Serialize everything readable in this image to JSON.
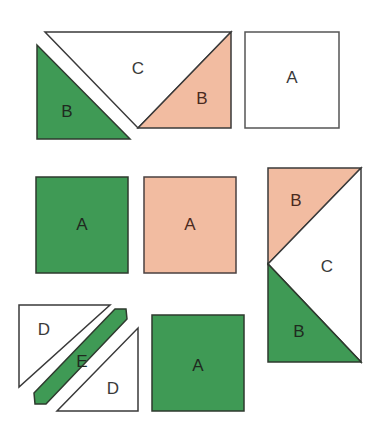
{
  "diagram": {
    "colors": {
      "green": "#3f9a55",
      "peach": "#f2bca1",
      "white": "#ffffff",
      "stroke": "#3a3a3a",
      "label_dark": "#1f2a1f",
      "label_brown": "#4a2a20",
      "label_gray": "#3a3a3a"
    },
    "pieces": [
      {
        "id": "top-c",
        "label": "C",
        "shape": "triangle",
        "fill": "white"
      },
      {
        "id": "top-b-green",
        "label": "B",
        "shape": "triangle",
        "fill": "green"
      },
      {
        "id": "top-b-peach",
        "label": "B",
        "shape": "triangle",
        "fill": "peach"
      },
      {
        "id": "top-a-white",
        "label": "A",
        "shape": "square",
        "fill": "white"
      },
      {
        "id": "mid-a-green",
        "label": "A",
        "shape": "square",
        "fill": "green"
      },
      {
        "id": "mid-a-peach",
        "label": "A",
        "shape": "square",
        "fill": "peach"
      },
      {
        "id": "right-b-peach",
        "label": "B",
        "shape": "triangle",
        "fill": "peach"
      },
      {
        "id": "right-c",
        "label": "C",
        "shape": "triangle",
        "fill": "white"
      },
      {
        "id": "right-b-green",
        "label": "B",
        "shape": "triangle",
        "fill": "green"
      },
      {
        "id": "bottom-d-upper",
        "label": "D",
        "shape": "triangle",
        "fill": "white"
      },
      {
        "id": "bottom-e",
        "label": "E",
        "shape": "strip",
        "fill": "green"
      },
      {
        "id": "bottom-d-lower",
        "label": "D",
        "shape": "triangle",
        "fill": "white"
      },
      {
        "id": "bottom-a-green",
        "label": "A",
        "shape": "square",
        "fill": "green"
      }
    ]
  }
}
